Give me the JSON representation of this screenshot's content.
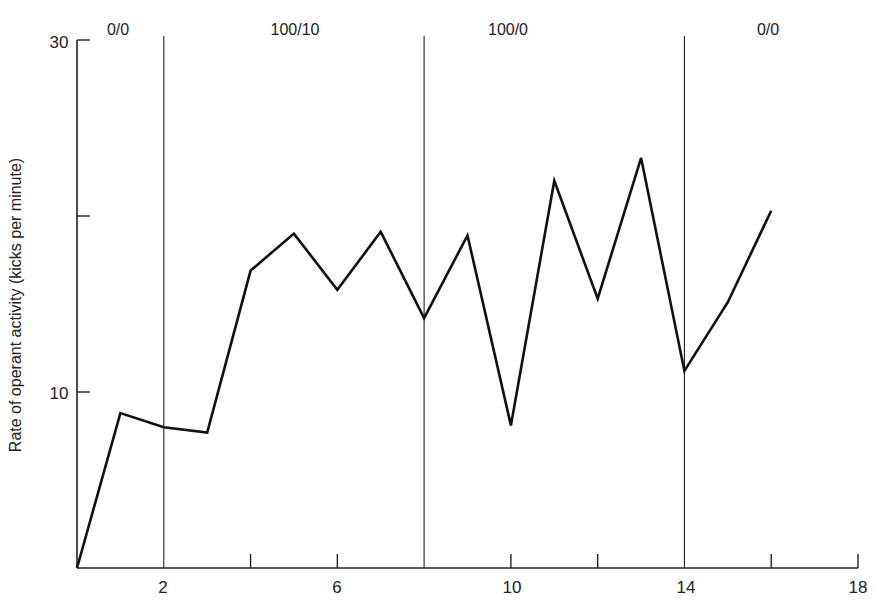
{
  "chart_data": {
    "type": "line",
    "title": "",
    "xlabel": "",
    "ylabel": "Rate of operant activity (kicks per minute)",
    "x": [
      0,
      1,
      2,
      3,
      4,
      5,
      6,
      7,
      8,
      9,
      10,
      11,
      12,
      13,
      14,
      15,
      16
    ],
    "series": [
      {
        "name": "Kicks per minute",
        "values": [
          0,
          8.8,
          8.0,
          7.7,
          16.9,
          19.0,
          15.8,
          19.1,
          14.2,
          18.9,
          8.1,
          22.0,
          15.3,
          23.3,
          11.2,
          15.1,
          20.3
        ]
      }
    ],
    "xlim": [
      0,
      18
    ],
    "ylim": [
      0,
      30
    ],
    "x_ticks": [
      2,
      4,
      6,
      8,
      10,
      12,
      14,
      16,
      18
    ],
    "x_tick_labels": [
      "2",
      "6",
      "10",
      "14",
      "18"
    ],
    "x_tick_label_values": [
      2,
      6,
      10,
      14,
      18
    ],
    "y_ticks": [
      10,
      20,
      30
    ],
    "y_tick_labels": [
      "10",
      "30"
    ],
    "y_tick_label_values": [
      10,
      30
    ],
    "grid": false,
    "legend": "none",
    "phase_lines": [
      2,
      8,
      14
    ],
    "phases": [
      {
        "label": "0/0",
        "x_center": 1
      },
      {
        "label": "100/10",
        "x_center": 5
      },
      {
        "label": "100/0",
        "x_center": 11
      },
      {
        "label": "0/0",
        "x_center": 16
      }
    ]
  },
  "labels": {
    "ylabel": "Rate of operant activity (kicks per minute)",
    "y30": "30",
    "y10": "10",
    "x2": "2",
    "x6": "6",
    "x10": "10",
    "x14": "14",
    "x18": "18",
    "phase1": "0/0",
    "phase2": "100/10",
    "phase3": "100/0",
    "phase4": "0/0"
  },
  "colors": {
    "line": "#111111",
    "axis": "#222222",
    "background": "#ffffff"
  }
}
